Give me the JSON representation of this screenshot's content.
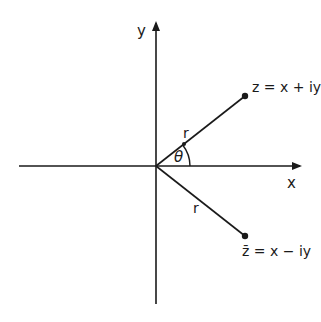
{
  "diagram": {
    "axes": {
      "x_label": "x",
      "y_label": "y"
    },
    "points": [
      {
        "name": "z",
        "label": "z = x + iy",
        "angle_deg": 38
      },
      {
        "name": "z-bar",
        "label": "z̄ = x − iy",
        "angle_deg": -38
      }
    ],
    "segments": [
      {
        "from": "origin",
        "to": "z",
        "label": "r"
      },
      {
        "from": "origin",
        "to": "z-bar",
        "label": "r"
      }
    ],
    "angle_label": "θ",
    "colors": {
      "ink": "#1a1a1a",
      "background": "#ffffff"
    }
  }
}
